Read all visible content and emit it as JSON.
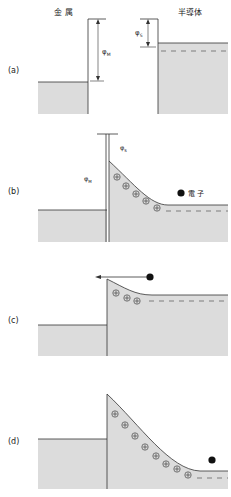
{
  "headers": {
    "metal": "金 属",
    "semiconductor": "半導体"
  },
  "panels": [
    {
      "label": "(a)"
    },
    {
      "label": "(b)"
    },
    {
      "label": "(c)"
    },
    {
      "label": "(d)"
    }
  ],
  "symbols": {
    "phi_m": "φ",
    "phi_m_sub": "M",
    "phi_s": "φ",
    "phi_s_sub": "S",
    "plus": "+"
  },
  "legend": {
    "electron_label": "電 子"
  },
  "colors": {
    "fill": "#dcdcdc",
    "line": "#333333",
    "dash": "#555555",
    "electron": "#111111"
  }
}
